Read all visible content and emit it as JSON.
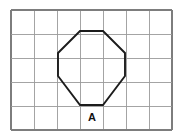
{
  "figure": {
    "background_color": "#ffffff",
    "width": 187,
    "height": 139
  },
  "grid": {
    "name": "square-grid",
    "columns": 7,
    "rows": 5,
    "cell_width": 23,
    "cell_height": 24,
    "origin_x": 11,
    "origin_y": 10,
    "line_color": "#9a9a9a",
    "border_color": "#7d7d7d",
    "vertical_lines_x": [
      11,
      34,
      57,
      80,
      103,
      126,
      149,
      172
    ],
    "horizontal_lines_y": [
      10,
      34,
      58,
      82,
      106,
      130
    ]
  },
  "shape": {
    "name": "octagon",
    "type": "regular-octagon",
    "sides": 8,
    "stroke_color": "#1c1c1c",
    "stroke_width": 1.9,
    "fill": "none",
    "vertices": [
      {
        "x": 80,
        "y": 31
      },
      {
        "x": 103,
        "y": 31
      },
      {
        "x": 125,
        "y": 53
      },
      {
        "x": 125,
        "y": 76
      },
      {
        "x": 103,
        "y": 105
      },
      {
        "x": 80,
        "y": 105
      },
      {
        "x": 58,
        "y": 76
      },
      {
        "x": 58,
        "y": 53
      }
    ],
    "points_attr": "80,31 103,31 125,53 125,76 103,105 80,105 58,76 58,53"
  },
  "label": {
    "name": "shape-label-a",
    "text": "A",
    "x": 92,
    "y": 121,
    "color": "#111111",
    "font_size": 11,
    "font_weight": "bold"
  }
}
